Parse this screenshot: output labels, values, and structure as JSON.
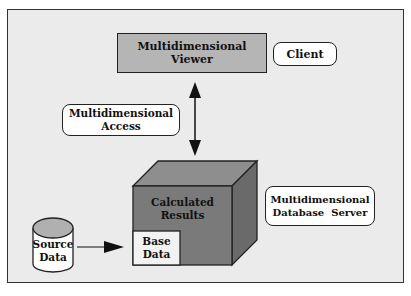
{
  "diagram": {
    "viewer": {
      "line1": "Multidimensional",
      "line2": "Viewer"
    },
    "client": {
      "label": "Client"
    },
    "access": {
      "line1": "Multidimensional",
      "line2": "Access"
    },
    "cube": {
      "line1": "Calculated",
      "line2": "Results"
    },
    "base": {
      "line1": "Base",
      "line2": "Data"
    },
    "source": {
      "line1": "Source",
      "line2": "Data"
    },
    "server": {
      "line1": "Multidimensional",
      "line2": "Database  Server"
    }
  },
  "colors": {
    "frame": "#ebebeb",
    "viewer": "#b5b5b5",
    "cube_front": "#7a7a7a",
    "cube_top": "#8e8e8e",
    "cube_side": "#6a6a6a",
    "cylinder_top": "#b0b0b0"
  }
}
